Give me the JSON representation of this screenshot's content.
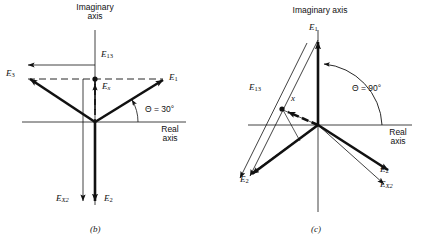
{
  "figure": {
    "type": "phasor-diagram-pair",
    "background": "#ffffff",
    "ink": "#111111",
    "width": 424,
    "height": 246
  },
  "panel_b": {
    "caption": "(b)",
    "axis_imaginary_line1": "Imaginary",
    "axis_imaginary_line2": "axis",
    "axis_real_line1": "Real",
    "axis_real_line2": "axis",
    "angle_label": "Θ = 30°",
    "angle_value_deg": 30,
    "origin": {
      "x": 95,
      "y": 122
    },
    "labels": {
      "e1": {
        "base": "E",
        "sub": "1"
      },
      "e2": {
        "base": "E",
        "sub": "2"
      },
      "e3": {
        "base": "E",
        "sub": "3"
      },
      "e13": {
        "base": "E",
        "sub": "13"
      },
      "ex": {
        "base": "E",
        "sub": "x"
      },
      "ex2": {
        "base": "E",
        "sub": "X2"
      }
    },
    "vectors": [
      {
        "name": "E1",
        "angle_deg": 30,
        "style": "thick-solid",
        "from": "origin",
        "to": [
          166,
          78
        ]
      },
      {
        "name": "E3",
        "angle_deg": 150,
        "style": "thick-solid",
        "from": "origin",
        "to": [
          28,
          78
        ]
      },
      {
        "name": "E2",
        "angle_deg": 270,
        "style": "thick-solid",
        "from": "origin",
        "to": [
          95,
          205
        ]
      },
      {
        "name": "Ex",
        "angle_deg": 90,
        "style": "thin-solid",
        "from": [
          95,
          122
        ],
        "to": [
          95,
          82
        ]
      },
      {
        "name": "Ex2",
        "angle_deg": 270,
        "style": "thin-solid",
        "from": [
          83,
          80
        ],
        "to": [
          83,
          205
        ]
      },
      {
        "name": "E13",
        "angle_deg": 180,
        "style": "thin-solid",
        "from": [
          95,
          65
        ],
        "to": [
          25,
          65
        ]
      }
    ]
  },
  "panel_c": {
    "caption": "(c)",
    "axis_imaginary": "Imaginary axis",
    "axis_real_line1": "Real",
    "axis_real_line2": "axis",
    "angle_label": "Θ = 90°",
    "angle_value_deg": 90,
    "origin": {
      "x": 318,
      "y": 125
    },
    "point_label": "x",
    "labels": {
      "e1": {
        "base": "E",
        "sub": "1"
      },
      "e2_left": {
        "base": "E",
        "sub": "2"
      },
      "e2_right": {
        "base": "E",
        "sub": "2"
      },
      "e13": {
        "base": "E",
        "sub": "13"
      },
      "ex2": {
        "base": "E",
        "sub": "X2"
      }
    },
    "vectors": [
      {
        "name": "E1",
        "angle_deg": 90,
        "style": "thick-solid",
        "from": "origin",
        "to": [
          318,
          38
        ]
      },
      {
        "name": "E2-left",
        "angle_deg": 210,
        "style": "thick-solid",
        "from": "origin",
        "to": [
          248,
          172
        ]
      },
      {
        "name": "E2-right",
        "angle_deg": -22,
        "style": "thick-solid",
        "from": "origin",
        "to": [
          392,
          173
        ]
      },
      {
        "name": "Ex2",
        "angle_deg": -28,
        "style": "thin-solid",
        "from": "origin",
        "to": [
          388,
          186
        ]
      },
      {
        "name": "Ex-dashed",
        "angle_deg": 150,
        "style": "thick-dashed",
        "from": "origin",
        "to": [
          283,
          109
        ]
      },
      {
        "name": "E13-a",
        "angle_deg": 208,
        "style": "thin-solid",
        "from": [
          318,
          38
        ],
        "to": [
          252,
          178
        ]
      },
      {
        "name": "E13-b",
        "angle_deg": 208,
        "style": "thin-solid",
        "from": [
          309,
          40
        ],
        "to": [
          243,
          180
        ]
      }
    ]
  }
}
